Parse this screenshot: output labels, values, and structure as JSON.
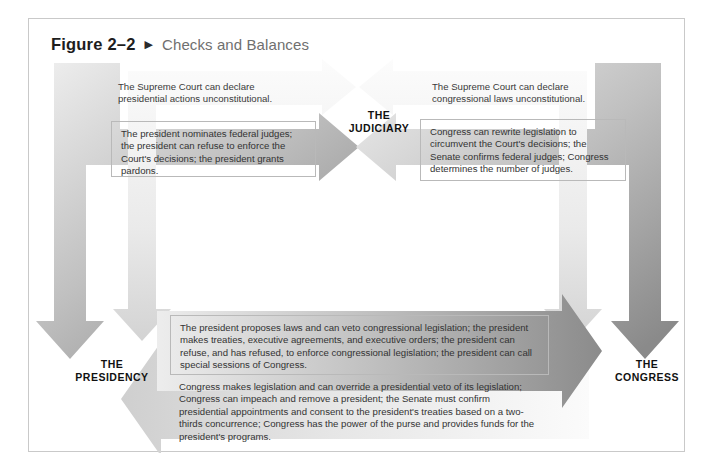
{
  "figure": {
    "number": "Figure 2–2",
    "pointer_icon": "▶",
    "title": "Checks and Balances"
  },
  "nodes": {
    "judiciary": "THE\nJUDICIARY",
    "judiciary_line1": "THE",
    "judiciary_line2": "JUDICIARY",
    "presidency_line1": "THE",
    "presidency_line2": "PRESIDENCY",
    "congress_line1": "THE",
    "congress_line2": "CONGRESS"
  },
  "flows": {
    "court_to_president": "The Supreme Court can declare presidential actions unconstitutional.",
    "president_to_court": "The president nominates federal judges; the president can refuse to enforce the Court's decisions; the president grants pardons.",
    "court_to_congress": "The Supreme Court can declare congressional laws unconstitutional.",
    "congress_to_court": "Congress can rewrite legislation to circumvent the Court's decisions; the Senate confirms federal judges; Congress determines the number of judges.",
    "president_to_congress": "The president proposes laws and can veto congressional legislation; the president makes treaties, executive agreements, and executive orders; the president can refuse, and has refused, to enforce congressional legislation; the president can call special sessions of Congress.",
    "congress_to_president": "Congress makes legislation and can override a presidential veto of its legislation; Congress can impeach and remove a president; the Senate must confirm presidential appointments and consent to the president's treaties based on a two-thirds concurrence; Congress has the power of the purse and provides funds for the president's programs."
  },
  "colors": {
    "arrow_dark_start": "#f0f0f0",
    "arrow_dark_end": "#8d8d8d",
    "arrow_light_start": "#fbfbfb",
    "arrow_light_end": "#cfcfcf",
    "frame_border": "#c9c9c9",
    "text": "#333333",
    "title_text": "#6f6f6f"
  }
}
